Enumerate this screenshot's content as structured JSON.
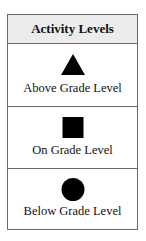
{
  "legend": {
    "title": "Activity Levels",
    "items": [
      {
        "symbol": "triangle-icon",
        "label": "Above Grade Level"
      },
      {
        "symbol": "square-icon",
        "label": "On Grade Level"
      },
      {
        "symbol": "circle-icon",
        "label": "Below Grade Level"
      }
    ]
  },
  "colors": {
    "header_bg": "#ececec",
    "border": "#6a6a6a",
    "symbol": "#000000"
  }
}
